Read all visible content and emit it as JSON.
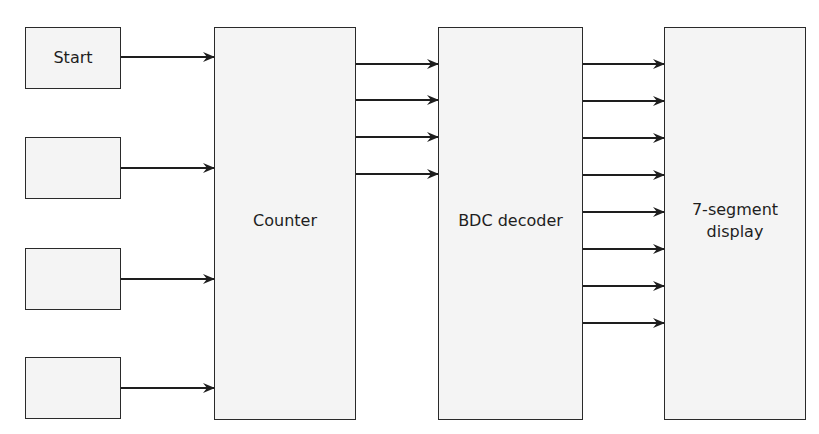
{
  "diagram": {
    "title": "",
    "colors": {
      "box_fill": "#f4f4f4",
      "stroke": "#1e1e1e"
    },
    "blocks": [
      {
        "id": "start",
        "label": "Start",
        "x": 25,
        "y": 27,
        "w": 96,
        "h": 62
      },
      {
        "id": "input2",
        "label": "",
        "x": 25,
        "y": 137,
        "w": 96,
        "h": 62
      },
      {
        "id": "input3",
        "label": "",
        "x": 25,
        "y": 248,
        "w": 96,
        "h": 62
      },
      {
        "id": "input4",
        "label": "",
        "x": 25,
        "y": 357,
        "w": 96,
        "h": 62
      },
      {
        "id": "counter",
        "label": "Counter",
        "x": 214,
        "y": 27,
        "w": 142,
        "h": 393
      },
      {
        "id": "bcd",
        "label": "BDC decoder",
        "x": 438,
        "y": 27,
        "w": 145,
        "h": 393
      },
      {
        "id": "display",
        "label": "7-segment\ndisplay",
        "x": 664,
        "y": 27,
        "w": 142,
        "h": 393
      }
    ],
    "connections": {
      "inputs_to_counter": {
        "from_x": 121,
        "to_x": 214,
        "y": [
          57,
          168,
          279,
          388
        ]
      },
      "counter_to_decoder": {
        "from_x": 356,
        "to_x": 438,
        "y": [
          64,
          100,
          137,
          174
        ]
      },
      "decoder_to_display": {
        "from_x": 583,
        "to_x": 664,
        "y": [
          64,
          101,
          138,
          175,
          212,
          249,
          286,
          323
        ]
      }
    }
  }
}
